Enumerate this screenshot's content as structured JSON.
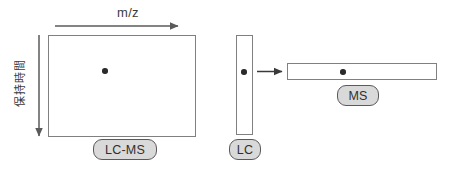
{
  "diagram": {
    "axes": {
      "x_axis_label": "m/z",
      "y_axis_label": "保持時間"
    },
    "panels": {
      "lcms_plot_badge": "LC-MS",
      "lc_bar_badge": "LC",
      "ms_bar_badge": "MS"
    },
    "icons": {
      "x_axis_arrow": "arrow-right-icon",
      "y_axis_arrow": "arrow-down-icon",
      "flow_arrow": "arrow-right-icon",
      "data_point": "data-point-icon"
    },
    "colors": {
      "panel_border": "#808080",
      "badge_fill": "#d9d9d9",
      "badge_border": "#5a5a5a",
      "arrow": "#5a5a5a",
      "data_point": "#2b2b2b",
      "text": "#3b3b3b",
      "background": "#ffffff"
    },
    "data_points": {
      "lcms_count": 1,
      "lc_count": 1,
      "ms_count": 1
    }
  }
}
